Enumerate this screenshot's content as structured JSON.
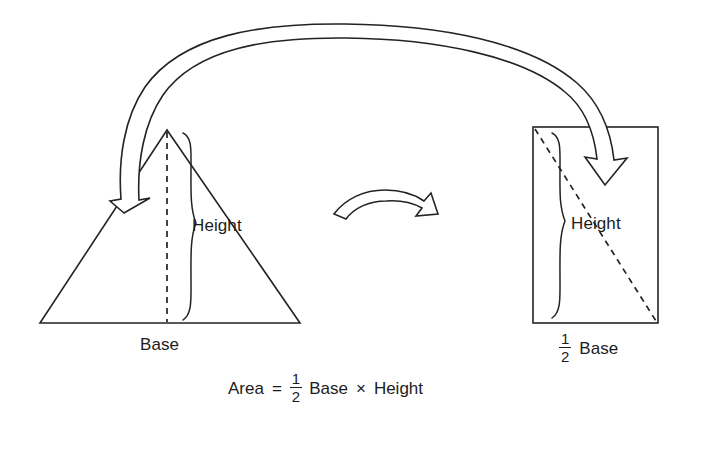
{
  "diagram": {
    "ink_color": "#232323",
    "text_color": "#1c1c1c",
    "background_color": "#ffffff"
  },
  "triangle": {
    "height_label": "Height",
    "base_label": "Base"
  },
  "rectangle": {
    "height_label": "Height",
    "base_label_fraction_numerator": "1",
    "base_label_fraction_denominator": "2",
    "base_label_text": "Base"
  },
  "formula": {
    "lhs": "Area",
    "equals": "=",
    "fraction_numerator": "1",
    "fraction_denominator": "2",
    "term_base": "Base",
    "multiply": "×",
    "term_height": "Height"
  },
  "arrows": {
    "transfer_arrow_name": "large-curved-transfer-arrow",
    "rotate_arrow_name": "rotation-arrow"
  }
}
